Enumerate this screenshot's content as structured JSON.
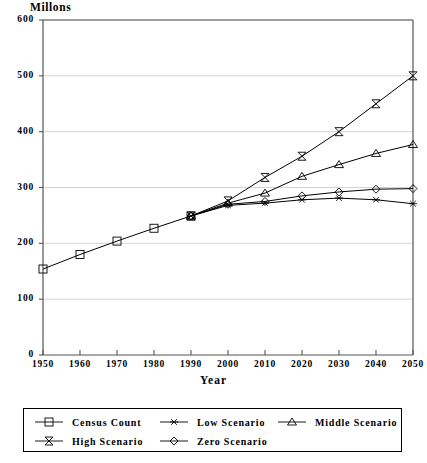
{
  "chart_data": {
    "type": "line",
    "title": "",
    "ylabel": "Millons",
    "xlabel": "Year",
    "x": [
      1950,
      1960,
      1970,
      1980,
      1990,
      2000,
      2010,
      2020,
      2030,
      2040,
      2050
    ],
    "xlim": [
      1950,
      2050
    ],
    "ylim": [
      0,
      600
    ],
    "ytick_labels": [
      "0",
      "100",
      "200",
      "300",
      "400",
      "500",
      "600"
    ],
    "ytick_values": [
      0,
      100,
      200,
      300,
      400,
      500,
      600
    ],
    "xtick_labels": [
      "1950",
      "1960",
      "1970",
      "1980",
      "1990",
      "2000",
      "2010",
      "2020",
      "2030",
      "2040",
      "2050"
    ],
    "grid": "horizontal",
    "legend_position": "bottom",
    "series": [
      {
        "name": "Census Count",
        "marker": "square",
        "x": [
          1950,
          1960,
          1970,
          1980,
          1990
        ],
        "values": [
          154,
          180,
          204,
          227,
          249
        ]
      },
      {
        "name": "Low Scenario",
        "marker": "asterisk",
        "x": [
          1990,
          2000,
          2010,
          2020,
          2030,
          2040,
          2050
        ],
        "values": [
          249,
          268,
          272,
          278,
          281,
          278,
          271
        ]
      },
      {
        "name": "Middle Scenario",
        "marker": "triangle",
        "x": [
          1990,
          2000,
          2010,
          2020,
          2030,
          2040,
          2050
        ],
        "values": [
          249,
          272,
          290,
          320,
          341,
          361,
          377
        ]
      },
      {
        "name": "High Scenario",
        "marker": "bowtie",
        "x": [
          1990,
          2000,
          2010,
          2020,
          2030,
          2040,
          2050
        ],
        "values": [
          249,
          276,
          318,
          356,
          400,
          450,
          500
        ]
      },
      {
        "name": "Zero Scenario",
        "marker": "diamond",
        "x": [
          1990,
          2000,
          2010,
          2020,
          2030,
          2040,
          2050
        ],
        "values": [
          249,
          270,
          275,
          285,
          292,
          297,
          298
        ]
      }
    ]
  },
  "legend": {
    "rows": [
      [
        {
          "label": "Census Count",
          "marker": "square"
        },
        {
          "label": "Low Scenario",
          "marker": "asterisk"
        },
        {
          "label": "Middle Scenario",
          "marker": "triangle"
        }
      ],
      [
        {
          "label": "High Scenario",
          "marker": "bowtie"
        },
        {
          "label": "Zero Scenario",
          "marker": "diamond"
        }
      ]
    ]
  },
  "colors": {
    "line": "#000000",
    "grid": "#c8c8c8",
    "axis": "#555555",
    "background": "#ffffff"
  }
}
